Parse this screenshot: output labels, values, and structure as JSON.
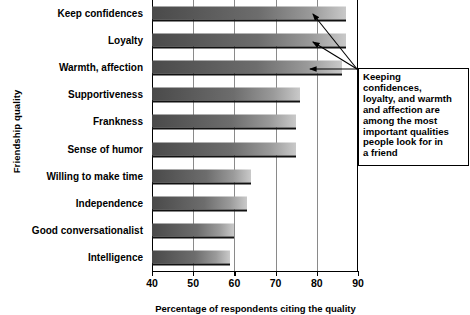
{
  "chart_data": {
    "type": "bar",
    "orientation": "horizontal",
    "title": "",
    "xlabel": "Percentage of respondents citing the quality",
    "ylabel": "Friendship quality",
    "xlim": [
      40,
      90
    ],
    "xticks": [
      40,
      50,
      60,
      70,
      80,
      90
    ],
    "grid": true,
    "legend": null,
    "categories": [
      "Keep confidences",
      "Loyalty",
      "Warmth, affection",
      "Supportiveness",
      "Frankness",
      "Sense of humor",
      "Willing to make time",
      "Independence",
      "Good conversationalist",
      "Intelligence"
    ],
    "values": [
      87,
      87,
      86,
      76,
      75,
      75,
      64,
      63,
      60,
      59
    ],
    "annotations": [
      {
        "text": "Keeping confidences, loyalty, and warmth and affection are among the most important qualities people look for in a friend",
        "points_to": [
          "Keep confidences",
          "Loyalty",
          "Warmth, affection"
        ]
      }
    ],
    "colors": {
      "bar_dark": "#4a4a4a",
      "bar_light": "#c9c9c9",
      "bar_edge": "#111111",
      "gridline": "#8a8a8a",
      "axis": "#000000",
      "background": "#ffffff"
    }
  },
  "annotation_lines": [
    "Keeping",
    "confidences,",
    "loyalty, and warmth",
    "and affection are",
    "among the most",
    "important qualities",
    "people look for in",
    "a friend"
  ]
}
